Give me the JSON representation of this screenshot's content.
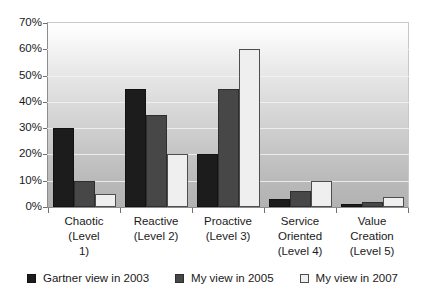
{
  "chart_data": {
    "type": "bar",
    "title": "",
    "subtitle": "",
    "xlabel": "",
    "ylabel": "",
    "ylim": [
      0,
      70
    ],
    "ytick_labels": [
      "0%",
      "10%",
      "20%",
      "30%",
      "40%",
      "50%",
      "60%",
      "70%"
    ],
    "ytick_values": [
      0,
      10,
      20,
      30,
      40,
      50,
      60,
      70
    ],
    "grid": true,
    "legend_position": "bottom",
    "categories": [
      "Chaotic (Level 1)",
      "Reactive (Level 2)",
      "Proactive (Level 3)",
      "Service Oriented (Level 4)",
      "Value Creation (Level 5)"
    ],
    "category_label_lines": [
      [
        "Chaotic (Level",
        "1)"
      ],
      [
        "Reactive",
        "(Level 2)"
      ],
      [
        "Proactive",
        "(Level 3)"
      ],
      [
        "Service",
        "Oriented",
        "(Level 4)"
      ],
      [
        "Value",
        "Creation",
        "(Level 5)"
      ]
    ],
    "series": [
      {
        "name": "Gartner view in 2003",
        "color": "#1c1c1c",
        "values": [
          30,
          45,
          20,
          3,
          1
        ]
      },
      {
        "name": "My view in 2005",
        "color": "#474747",
        "values": [
          10,
          35,
          45,
          6,
          2
        ]
      },
      {
        "name": "My view in 2007",
        "color": "#efefef",
        "values": [
          5,
          20,
          60,
          10,
          4
        ]
      }
    ]
  },
  "legend": {
    "items": [
      {
        "label": "Gartner view in 2003",
        "swatch": "legend-swatch-black"
      },
      {
        "label": "My view in 2005",
        "swatch": "legend-swatch-darkgray"
      },
      {
        "label": "My view in 2007",
        "swatch": "legend-swatch-white"
      }
    ]
  }
}
